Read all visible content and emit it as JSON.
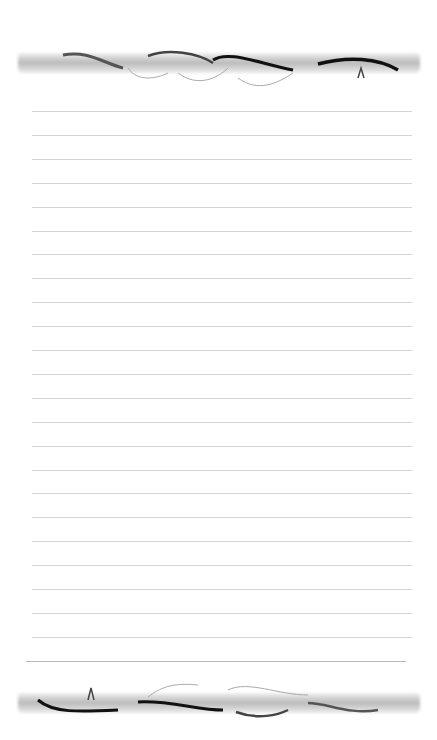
{
  "page": {
    "type": "lined notepaper",
    "background": "#ffffff",
    "line_color": "#d4d4d4",
    "line_count": 24,
    "first_line_y": 111,
    "line_spacing": 23.9
  },
  "decorations": {
    "top": {
      "name": "vine-border",
      "color": "#2a2a2a"
    },
    "bottom": {
      "name": "vine-border",
      "color": "#2a2a2a"
    }
  }
}
